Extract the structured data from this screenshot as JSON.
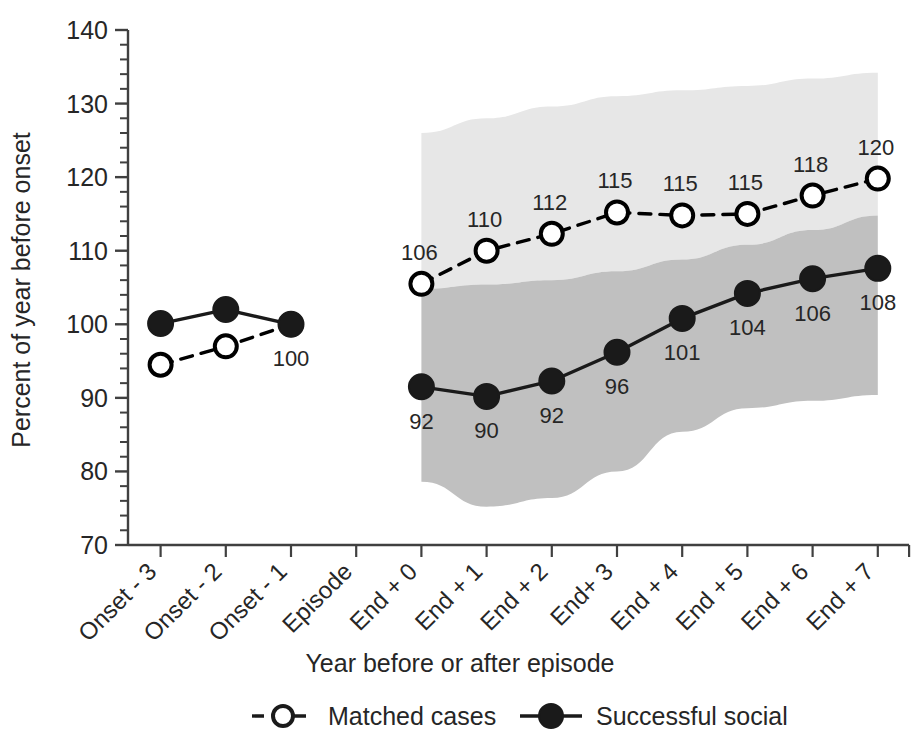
{
  "chart_data": {
    "type": "line",
    "title": "",
    "xlabel": "Year before or after episode",
    "ylabel": "Percent of year before onset",
    "ylim": [
      70,
      140
    ],
    "yticks": [
      70,
      80,
      90,
      100,
      110,
      120,
      130,
      140
    ],
    "ytick_labels": [
      "70",
      "80",
      "90",
      "100",
      "110",
      "120",
      "130",
      "140"
    ],
    "minor_tick_step": 2,
    "grid": false,
    "legend_position": "bottom",
    "categories": [
      "Onset - 3",
      "Onset - 2",
      "Onset - 1",
      "Episode",
      "End + 0",
      "End + 1",
      "End + 2",
      "End+ 3",
      "End + 4",
      "End + 5",
      "End + 6",
      "End + 7"
    ],
    "series": [
      {
        "name": "Matched cases",
        "style": "dashed",
        "marker": "open-circle",
        "color": "#000000",
        "values": [
          94.5,
          97.0,
          100.0,
          null,
          105.5,
          110.0,
          112.3,
          115.2,
          114.8,
          115.0,
          117.5,
          119.8
        ],
        "labels": [
          "",
          "",
          "",
          "",
          "106",
          "110",
          "112",
          "115",
          "115",
          "115",
          "118",
          "120"
        ],
        "band": {
          "name": "Matched cases confidence band",
          "color": "#e6e6e6",
          "upper": [
            null,
            null,
            null,
            null,
            126.0,
            128.0,
            129.6,
            131.0,
            131.8,
            132.4,
            133.4,
            134.2
          ],
          "lower": [
            null,
            null,
            null,
            null,
            104.8,
            105.4,
            106.0,
            107.2,
            108.8,
            110.8,
            112.8,
            114.8
          ]
        }
      },
      {
        "name": "Successful social",
        "style": "solid",
        "marker": "filled-circle",
        "color": "#1a1a1a",
        "values": [
          100.1,
          102.0,
          100.0,
          null,
          91.5,
          90.2,
          92.3,
          96.2,
          100.8,
          104.2,
          106.2,
          107.6
        ],
        "labels": [
          "",
          "",
          "100",
          "",
          "92",
          "90",
          "92",
          "96",
          "101",
          "104",
          "106",
          "108"
        ],
        "band": {
          "name": "Successful social confidence band",
          "color": "#bfbfbf",
          "upper": [
            null,
            null,
            null,
            null,
            104.8,
            105.4,
            106.0,
            107.2,
            108.8,
            110.8,
            112.8,
            114.8
          ],
          "lower": [
            null,
            null,
            null,
            null,
            78.6,
            75.2,
            76.4,
            80.0,
            85.4,
            88.6,
            89.6,
            90.4
          ]
        }
      }
    ]
  },
  "legend": {
    "items": [
      {
        "label": "Matched cases",
        "marker": "open-circle",
        "style": "dashed"
      },
      {
        "label": "Successful social",
        "marker": "filled-circle",
        "style": "solid"
      }
    ]
  },
  "axes": {
    "y_title": "Percent of year before onset",
    "x_title": "Year before or after episode"
  }
}
